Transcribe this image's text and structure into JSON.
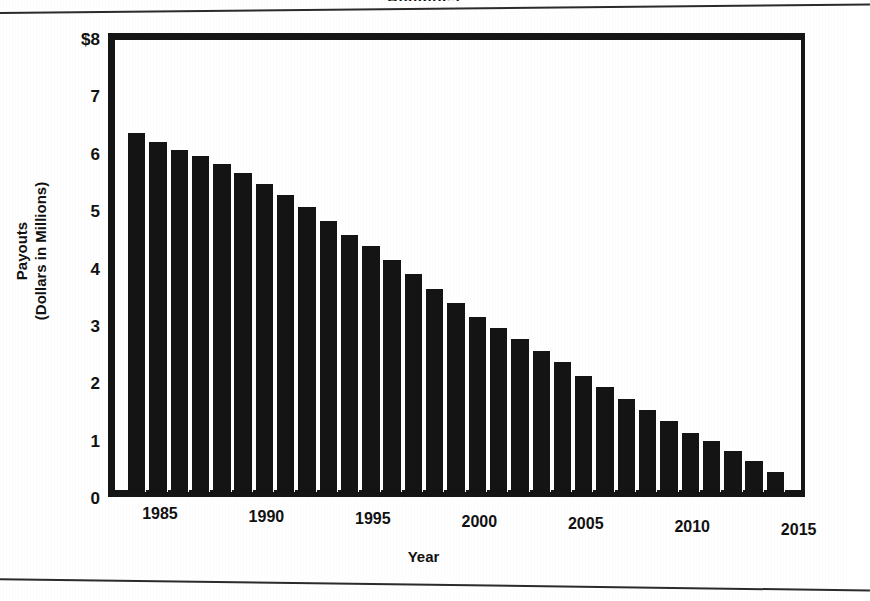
{
  "figure": {
    "clipped_title_fragment": "Annuities",
    "background_color": "#ffffff",
    "ink_color": "#141414"
  },
  "chart_data": {
    "type": "bar",
    "title": "",
    "xlabel": "Year",
    "ylabel": "Payouts (Dollars in Millions)",
    "ylabel_lines": [
      "Payouts",
      "(Dollars in Millions)"
    ],
    "ylim": [
      0,
      8
    ],
    "grid": false,
    "legend": null,
    "y_tick_labels": [
      "$8",
      "7",
      "6",
      "5",
      "4",
      "3",
      "2",
      "1",
      "0"
    ],
    "y_tick_values": [
      8,
      7,
      6,
      5,
      4,
      3,
      2,
      1,
      0
    ],
    "x_tick_labels": [
      "1985",
      "1990",
      "1995",
      "2000",
      "2005",
      "2010",
      "2015"
    ],
    "x_tick_values": [
      1985,
      1990,
      1995,
      2000,
      2005,
      2010,
      2015
    ],
    "xlim": [
      1983.5,
      2015.5
    ],
    "categories": [
      1984,
      1985,
      1986,
      1987,
      1988,
      1989,
      1990,
      1991,
      1992,
      1993,
      1994,
      1995,
      1996,
      1997,
      1998,
      1999,
      2000,
      2001,
      2002,
      2003,
      2004,
      2005,
      2006,
      2007,
      2008,
      2009,
      2010,
      2011,
      2012,
      2013,
      2014
    ],
    "values": [
      6.35,
      6.2,
      6.05,
      5.95,
      5.8,
      5.65,
      5.45,
      5.25,
      5.05,
      4.8,
      4.55,
      4.35,
      4.1,
      3.85,
      3.6,
      3.35,
      3.1,
      2.9,
      2.7,
      2.5,
      2.3,
      2.05,
      1.85,
      1.65,
      1.45,
      1.25,
      1.05,
      0.9,
      0.72,
      0.55,
      0.35
    ],
    "units": "millions of dollars",
    "bar_color": "#141414"
  }
}
